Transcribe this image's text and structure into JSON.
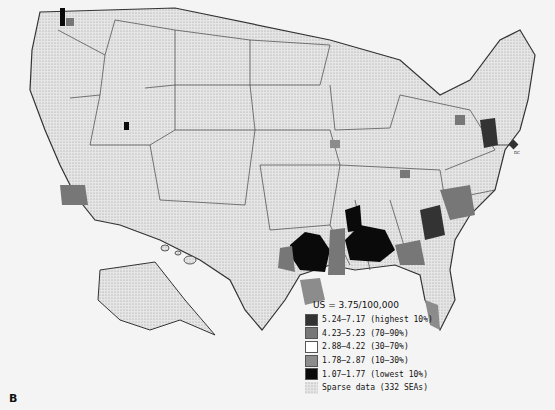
{
  "panel_label": "B",
  "legend": {
    "title": "US = 3.75/100,000",
    "items": [
      {
        "label": "5.24–7.17 (highest 10%)",
        "color": "#333333"
      },
      {
        "label": "4.23–5.23 (70–90%)",
        "color": "#777777"
      },
      {
        "label": "2.88–4.22 (30–70%)",
        "color": "#ffffff"
      },
      {
        "label": "1.78–2.87 (10–30%)",
        "color": "#8c8c8c"
      },
      {
        "label": "1.07–1.77 (lowest 10%)",
        "color": "#0a0a0a"
      },
      {
        "label": "Sparse data (332 SEAs)",
        "color": "dotted"
      }
    ]
  },
  "annotations": {
    "dc_label": "DC"
  },
  "colors": {
    "background": "#f4f4f4",
    "border": "#333333",
    "sparse": "#dcdcdc"
  }
}
